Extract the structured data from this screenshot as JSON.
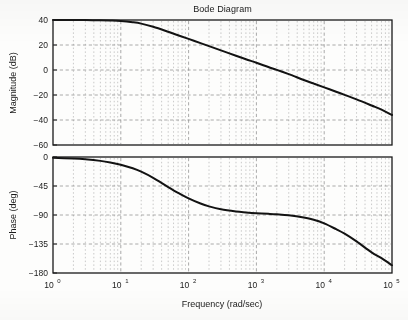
{
  "title": "Bode Diagram",
  "xlabel": "Frequency (rad/sec)",
  "panels": {
    "magnitude": {
      "ylabel": "Magnitude (dB)"
    },
    "phase": {
      "ylabel": "Phase (deg)"
    }
  },
  "ticks": {
    "x": [
      {
        "mant": "10",
        "exp": "0"
      },
      {
        "mant": "10",
        "exp": "1"
      },
      {
        "mant": "10",
        "exp": "2"
      },
      {
        "mant": "10",
        "exp": "3"
      },
      {
        "mant": "10",
        "exp": "4"
      },
      {
        "mant": "10",
        "exp": "5"
      }
    ],
    "mag_y": [
      "40",
      "20",
      "0",
      "−20",
      "−40",
      "−60"
    ],
    "phase_y": [
      "0",
      "−45",
      "−90",
      "−135",
      "−180"
    ]
  },
  "colors": {
    "curve": "#121212",
    "frame": "#1a1a1a",
    "major_grid": "#8d8d8d",
    "minor_grid": "#a6a6a6",
    "background": "#fdfdfc"
  },
  "chart_data": {
    "type": "line",
    "title": "Bode Diagram",
    "xlabel": "Frequency (rad/sec)",
    "xscale": "log",
    "xlim": [
      1,
      100000
    ],
    "xticks": [
      1,
      10,
      100,
      1000,
      10000,
      100000
    ],
    "grid": true,
    "legend": null,
    "subplots": [
      {
        "name": "magnitude",
        "ylabel": "Magnitude (dB)",
        "ylim": [
          -60,
          40
        ],
        "yticks": [
          40,
          20,
          0,
          -20,
          -40,
          -60
        ],
        "series": [
          {
            "name": "magnitude",
            "x": [
              1,
              2,
              3,
              5,
              7,
              10,
              15,
              20,
              30,
              50,
              70,
              100,
              150,
              200,
              300,
              500,
              700,
              1000,
              1500,
              2000,
              3000,
              3500,
              5000,
              7000,
              10000,
              15000,
              20000,
              30000,
              50000,
              70000,
              100000
            ],
            "y": [
              40.0,
              40.0,
              39.9,
              39.8,
              39.6,
              39.2,
              38.2,
              37.1,
              34.6,
              30.6,
              27.8,
              24.9,
              21.5,
              19.1,
              15.7,
              11.4,
              8.6,
              5.8,
              2.4,
              0.1,
              -3.3,
              -4.7,
              -8.0,
              -10.9,
              -13.9,
              -17.4,
              -19.9,
              -23.5,
              -28.4,
              -31.7,
              -36.0
            ]
          }
        ]
      },
      {
        "name": "phase",
        "ylabel": "Phase (deg)",
        "ylim": [
          -180,
          0
        ],
        "yticks": [
          0,
          -45,
          -90,
          -135,
          -180
        ],
        "series": [
          {
            "name": "phase",
            "x": [
              1,
              2,
              3,
              5,
              7,
              10,
              15,
              20,
              30,
              50,
              70,
              100,
              150,
              200,
              300,
              500,
              700,
              1000,
              1500,
              2000,
              3000,
              5000,
              7000,
              10000,
              15000,
              20000,
              30000,
              50000,
              70000,
              100000
            ],
            "y": [
              -1.2,
              -2.4,
              -3.6,
              -6.0,
              -8.4,
              -11.9,
              -17.5,
              -22.8,
              -32.3,
              -46.6,
              -55.6,
              -64.2,
              -72.2,
              -76.6,
              -81.2,
              -84.6,
              -86.0,
              -87.2,
              -88.2,
              -89.0,
              -90.5,
              -94.0,
              -97.5,
              -103.0,
              -112.0,
              -119.0,
              -131.0,
              -148.0,
              -157.0,
              -168.0
            ]
          }
        ]
      }
    ],
    "annotations": [
      "Magnitude is flat at 40 dB below ~10 rad/sec then rolls off, crossing 0 dB near 2000 rad/sec and reaching about -50 dB at 1e5 rad/sec.",
      "Phase starts at 0 deg, drops through -45 deg near 40 rad/sec, plateaus around -90 deg between ~300 and ~3000 rad/sec, then descends toward -180 deg at 1e5 rad/sec."
    ]
  }
}
